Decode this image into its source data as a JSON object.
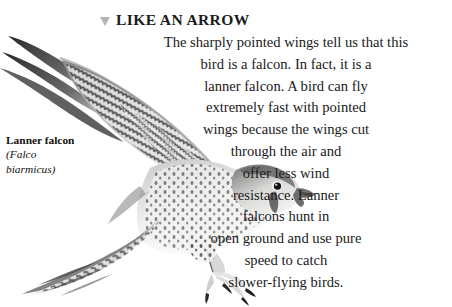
{
  "page": {
    "background_color": "#ffffff",
    "text_color": "#1a1a1a"
  },
  "heading": {
    "marker_icon": "triangle-down-icon",
    "marker_color": "#b4b4b4",
    "text": "LIKE AN ARROW"
  },
  "body": {
    "alignment": "center",
    "lines": [
      "The sharply pointed wings tell us that this",
      "bird is a falcon. In fact, it is a",
      "lanner falcon. A bird can fly",
      "extremely fast with pointed",
      "wings because the wings cut",
      "through the air and",
      "offer less wind",
      "resistance. Lanner",
      "falcons hunt in",
      "open ground and use pure",
      "speed to catch",
      "slower-flying birds."
    ],
    "full_text": "The sharply pointed wings tell us that this bird is a falcon. In fact, it is a lanner falcon. A bird can fly extremely fast with pointed wings because the wings cut through the air and offer less wind resistance. Lanner falcons hunt in open ground and use pure speed to catch slower-flying birds."
  },
  "caption": {
    "common_name": "Lanner falcon",
    "scientific_name_line1": "(Falco",
    "scientific_name_line2": "biarmicus)"
  },
  "figure": {
    "style": "grayscale-photograph"
  }
}
